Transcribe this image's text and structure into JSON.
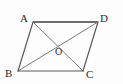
{
  "figure": {
    "name": "parallelogram-abcd-with-diagonals",
    "kind": "geometry-diagram",
    "background_color": "#fdfdfd",
    "stroke_color": "#4a4a4a",
    "edge_stroke_color": "#5a5a5a",
    "top_edge_stroke_color": "#6e6e6e",
    "label_color": "#2a2a2a",
    "width": 123,
    "height": 84
  },
  "points": {
    "A": {
      "label": "A",
      "x": 33,
      "y": 22,
      "label_x": 20,
      "label_y": 13
    },
    "B": {
      "label": "B",
      "x": 18,
      "y": 71,
      "label_x": 5,
      "label_y": 68
    },
    "C": {
      "label": "C",
      "x": 83,
      "y": 71,
      "label_x": 86,
      "label_y": 69
    },
    "D": {
      "label": "D",
      "x": 98,
      "y": 22,
      "label_x": 100,
      "label_y": 13
    },
    "O": {
      "label": "O",
      "x": 58,
      "y": 46,
      "label_x": 55,
      "label_y": 47
    }
  },
  "segments": [
    {
      "name": "side-AD",
      "from": "A",
      "to": "D",
      "kind": "side",
      "width": 2.0,
      "color": "#6e6e6e"
    },
    {
      "name": "side-AB",
      "from": "A",
      "to": "B",
      "kind": "side",
      "width": 1.2,
      "color": "#5a5a5a"
    },
    {
      "name": "side-DC",
      "from": "D",
      "to": "C",
      "kind": "side",
      "width": 1.2,
      "color": "#5a5a5a"
    },
    {
      "name": "side-BC",
      "from": "B",
      "to": "C",
      "kind": "side",
      "width": 1.2,
      "color": "#5a5a5a"
    },
    {
      "name": "diagonal-AC",
      "from": "A",
      "to": "C",
      "kind": "diagonal",
      "width": 0.9,
      "color": "#6a6a6a"
    },
    {
      "name": "diagonal-BD",
      "from": "B",
      "to": "D",
      "kind": "diagonal",
      "width": 0.9,
      "color": "#6a6a6a"
    }
  ]
}
